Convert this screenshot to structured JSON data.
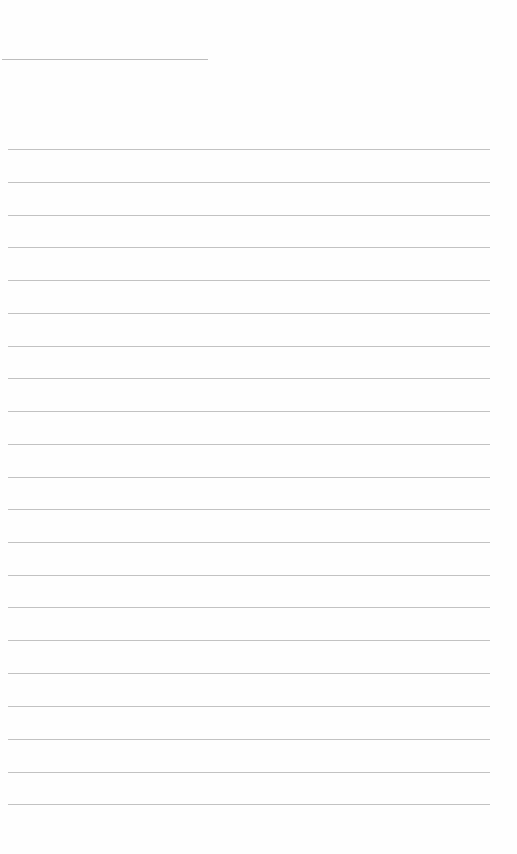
{
  "page": {
    "type": "lined-notepad",
    "background_color": "#fefefe",
    "line_color": "#c2c2c2"
  },
  "header": {
    "title_text": ""
  },
  "lines": [
    {
      "text": ""
    },
    {
      "text": ""
    },
    {
      "text": ""
    },
    {
      "text": ""
    },
    {
      "text": ""
    },
    {
      "text": ""
    },
    {
      "text": ""
    },
    {
      "text": ""
    },
    {
      "text": ""
    },
    {
      "text": ""
    },
    {
      "text": ""
    },
    {
      "text": ""
    },
    {
      "text": ""
    },
    {
      "text": ""
    },
    {
      "text": ""
    },
    {
      "text": ""
    },
    {
      "text": ""
    },
    {
      "text": ""
    },
    {
      "text": ""
    },
    {
      "text": ""
    },
    {
      "text": ""
    }
  ]
}
